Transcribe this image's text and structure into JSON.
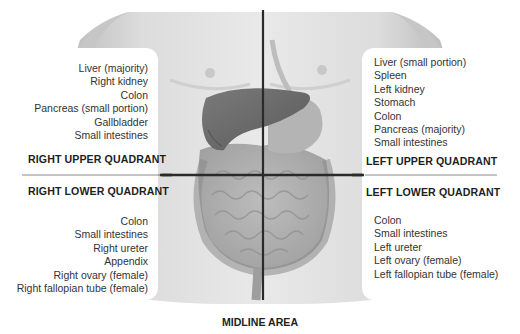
{
  "diagram": {
    "quadrants": {
      "right_upper": {
        "title": "RIGHT UPPER QUADRANT",
        "organs": [
          "Liver (majority)",
          "Right kidney",
          "Colon",
          "Pancreas (small portion)",
          "Gallbladder",
          "Small intestines"
        ]
      },
      "left_upper": {
        "title": "LEFT UPPER QUADRANT",
        "organs": [
          "Liver (small portion)",
          "Spleen",
          "Left kidney",
          "Stomach",
          "Colon",
          "Pancreas (majority)",
          "Small intestines"
        ]
      },
      "right_lower": {
        "title": "RIGHT LOWER QUADRANT",
        "organs": [
          "Colon",
          "Small intestines",
          "Right ureter",
          "Appendix",
          "Right ovary (female)",
          "Right fallopian tube (female)"
        ]
      },
      "left_lower": {
        "title": "LEFT LOWER QUADRANT",
        "organs": [
          "Colon",
          "Small intestines",
          "Left ureter",
          "Left ovary (female)",
          "Left fallopian tube (female)"
        ]
      }
    },
    "midline": {
      "title": "MIDLINE AREA"
    },
    "colors": {
      "skin_light": "#e6e6e6",
      "skin_shadow": "#bdbdbd",
      "liver": "#6e6e6e",
      "intestines": "#a9a9a9",
      "divider_lines": "#2a2a2a"
    }
  }
}
